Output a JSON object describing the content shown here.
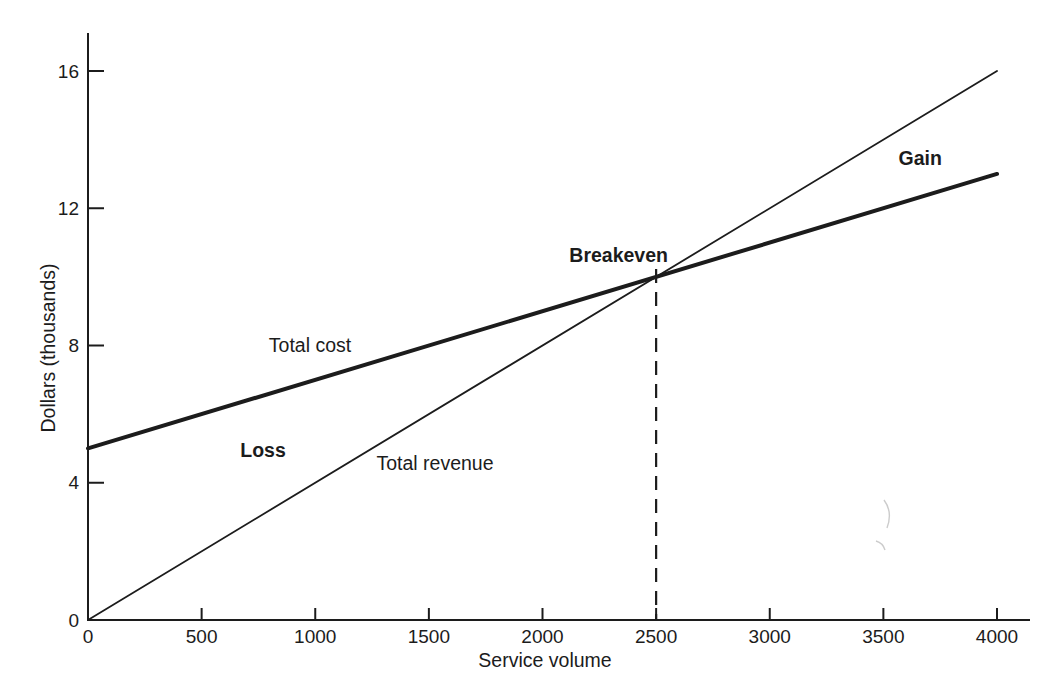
{
  "chart_data": {
    "type": "line",
    "title": "",
    "xlabel": "Service volume",
    "ylabel": "Dollars (thousands)",
    "xlim": [
      0,
      4000
    ],
    "ylim": [
      0,
      16
    ],
    "xticks": [
      0,
      500,
      1000,
      1500,
      2000,
      2500,
      3000,
      3500,
      4000
    ],
    "yticks": [
      0,
      4,
      8,
      12,
      16
    ],
    "grid": false,
    "legend_position": "none-inline-labels",
    "series": [
      {
        "name": "Total revenue",
        "x": [
          0,
          4000
        ],
        "values": [
          0,
          16
        ],
        "line_weight": "thin"
      },
      {
        "name": "Total cost",
        "x": [
          0,
          4000
        ],
        "values": [
          5,
          13
        ],
        "line_weight": "thick"
      }
    ],
    "breakeven_point": {
      "x": 2500,
      "y": 10,
      "marker": "dashed-vertical-line"
    },
    "annotations": [
      {
        "text": "Total cost",
        "x": 977,
        "y": 7.81,
        "bold": false
      },
      {
        "text": "Total revenue",
        "x": 1527,
        "y": 4.37,
        "bold": false
      },
      {
        "text": "Loss",
        "x": 770,
        "y": 4.75,
        "bold": true
      },
      {
        "text": "Gain",
        "x": 3662,
        "y": 13.26,
        "bold": true
      },
      {
        "text": "Breakeven",
        "x": 2335,
        "y": 10.43,
        "bold": true
      }
    ],
    "ink_color": "#1c1c1c",
    "background_color": "#ffffff"
  }
}
